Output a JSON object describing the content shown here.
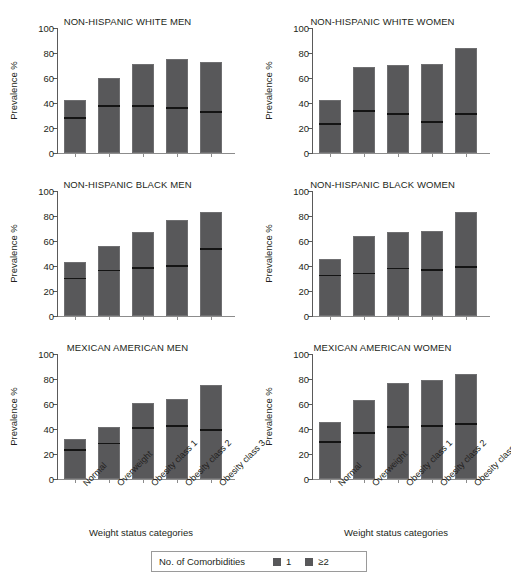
{
  "figure": {
    "xaxis_title": "Weight status categories",
    "yaxis_title": "Prevalence %",
    "ytick_labels": [
      "0",
      "20",
      "40",
      "60",
      "80",
      "100"
    ],
    "category_labels": [
      "Normal",
      "Overweight",
      "Obesity class 1",
      "Obesity class 2",
      "Obesity class 3"
    ],
    "colors": {
      "bar_fill": "#58585a",
      "divider": "#141414",
      "axis": "#5a5a5a",
      "text": "#231f20"
    }
  },
  "legend": {
    "title": "No. of Comorbidities",
    "entries": [
      {
        "label": "1",
        "swatch": "#58585a"
      },
      {
        "label": "≥2",
        "swatch": "#58585a"
      }
    ]
  },
  "chart_data": {
    "type": "bar",
    "xlabel": "Weight status categories",
    "ylabel": "Prevalence %",
    "ylim": [
      0,
      100
    ],
    "yticks": [
      0,
      20,
      40,
      60,
      80,
      100
    ],
    "grid": false,
    "legend_position": "bottom-center",
    "stacked": true,
    "categories": [
      "Normal",
      "Overweight",
      "Obesity class 1",
      "Obesity class 2",
      "Obesity class 3"
    ],
    "panels": [
      {
        "title": "NON-HISPANIC WHITE MEN",
        "row": 0,
        "col": 0,
        "series": [
          {
            "name": "1",
            "values": [
              29.5,
              39.0,
              39.0,
              37.5,
              34.5
            ]
          },
          {
            "name": "≥2",
            "values": [
              13.0,
              21.0,
              32.0,
              37.5,
              38.0
            ]
          }
        ],
        "totals": [
          42.5,
          60.0,
          71.0,
          75.0,
          72.5
        ]
      },
      {
        "title": "NON-HISPANIC WHITE WOMEN",
        "row": 0,
        "col": 1,
        "series": [
          {
            "name": "1",
            "values": [
              24.5,
              35.0,
              32.5,
              26.5,
              33.0
            ]
          },
          {
            "name": "≥2",
            "values": [
              18.0,
              34.0,
              38.0,
              45.0,
              51.0
            ]
          }
        ],
        "totals": [
          42.5,
          69.0,
          70.5,
          71.5,
          84.0
        ]
      },
      {
        "title": "NON-HISPANIC BLACK MEN",
        "row": 1,
        "col": 0,
        "series": [
          {
            "name": "1",
            "values": [
              31.5,
              38.0,
              40.0,
              41.5,
              55.0
            ]
          },
          {
            "name": "≥2",
            "values": [
              12.0,
              18.0,
              27.0,
              35.0,
              28.0
            ]
          }
        ],
        "totals": [
          43.5,
          56.0,
          67.0,
          76.5,
          83.0
        ]
      },
      {
        "title": "NON-HISPANIC BLACK WOMEN",
        "row": 1,
        "col": 1,
        "series": [
          {
            "name": "1",
            "values": [
              34.0,
              35.5,
              39.5,
              38.5,
              41.0
            ]
          },
          {
            "name": "≥2",
            "values": [
              11.5,
              28.5,
              28.0,
              29.5,
              42.0
            ]
          }
        ],
        "totals": [
          45.5,
          64.0,
          67.5,
          68.0,
          83.0
        ]
      },
      {
        "title": "MEXICAN AMERICAN MEN",
        "row": 2,
        "col": 0,
        "series": [
          {
            "name": "1",
            "values": [
              24.5,
              30.0,
              42.5,
              44.0,
              40.5
            ]
          },
          {
            "name": "≥2",
            "values": [
              7.5,
              12.0,
              18.5,
              20.0,
              35.0
            ]
          }
        ],
        "totals": [
          32.0,
          42.0,
          61.0,
          64.0,
          75.5
        ]
      },
      {
        "title": "MEXICAN AMERICAN WOMEN",
        "row": 2,
        "col": 1,
        "series": [
          {
            "name": "1",
            "values": [
              31.0,
              38.5,
              43.0,
              44.0,
              45.5
            ]
          },
          {
            "name": "≥2",
            "values": [
              14.5,
              25.0,
              34.0,
              35.5,
              38.5
            ]
          }
        ],
        "totals": [
          45.5,
          63.5,
          77.0,
          79.5,
          84.0
        ]
      }
    ]
  }
}
